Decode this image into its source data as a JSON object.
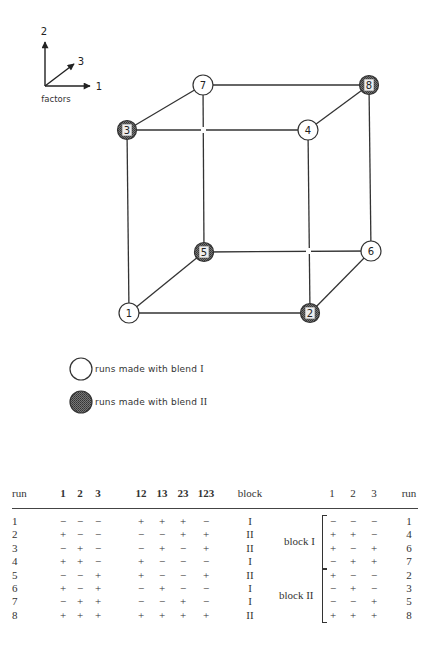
{
  "factors_key": {
    "label": "factors",
    "axis_1": "1",
    "axis_2": "2",
    "axis_3": "3"
  },
  "cube": {
    "nodes": [
      {
        "run": "1",
        "blend": "I"
      },
      {
        "run": "2",
        "blend": "II"
      },
      {
        "run": "3",
        "blend": "II"
      },
      {
        "run": "4",
        "blend": "I"
      },
      {
        "run": "5",
        "blend": "II"
      },
      {
        "run": "6",
        "blend": "I"
      },
      {
        "run": "7",
        "blend": "I"
      },
      {
        "run": "8",
        "blend": "II"
      }
    ],
    "colors": {
      "line": "#333333",
      "blend_I_fill": "#ffffff",
      "blend_II_fill": "#5a5a5a"
    }
  },
  "legend": {
    "blend_I_text": "runs made with blend",
    "blend_I_roman": "I",
    "blend_II_text": "runs made with blend",
    "blend_II_roman": "II"
  },
  "table": {
    "headers": {
      "run": "run",
      "c1": "1",
      "c2": "2",
      "c3": "3",
      "c12": "12",
      "c13": "13",
      "c23": "23",
      "c123": "123",
      "block": "block",
      "r1": "1",
      "r2": "2",
      "r3": "3",
      "rrun": "run"
    },
    "rows": [
      {
        "run": "1",
        "f1": "−",
        "f2": "−",
        "f3": "−",
        "i12": "+",
        "i13": "+",
        "i23": "+",
        "i123": "−",
        "block": "I"
      },
      {
        "run": "2",
        "f1": "+",
        "f2": "−",
        "f3": "−",
        "i12": "−",
        "i13": "−",
        "i23": "+",
        "i123": "+",
        "block": "II"
      },
      {
        "run": "3",
        "f1": "−",
        "f2": "+",
        "f3": "−",
        "i12": "−",
        "i13": "+",
        "i23": "−",
        "i123": "+",
        "block": "II"
      },
      {
        "run": "4",
        "f1": "+",
        "f2": "+",
        "f3": "−",
        "i12": "+",
        "i13": "−",
        "i23": "−",
        "i123": "−",
        "block": "I"
      },
      {
        "run": "5",
        "f1": "−",
        "f2": "−",
        "f3": "+",
        "i12": "+",
        "i13": "−",
        "i23": "−",
        "i123": "+",
        "block": "II"
      },
      {
        "run": "6",
        "f1": "+",
        "f2": "−",
        "f3": "+",
        "i12": "−",
        "i13": "+",
        "i23": "−",
        "i123": "−",
        "block": "I"
      },
      {
        "run": "7",
        "f1": "−",
        "f2": "+",
        "f3": "+",
        "i12": "−",
        "i13": "−",
        "i23": "+",
        "i123": "−",
        "block": "I"
      },
      {
        "run": "8",
        "f1": "+",
        "f2": "+",
        "f3": "+",
        "i12": "+",
        "i13": "+",
        "i23": "+",
        "i123": "+",
        "block": "II"
      }
    ],
    "blocks": [
      {
        "label": "block I",
        "rows": [
          {
            "f1": "−",
            "f2": "−",
            "f3": "−",
            "run": "1"
          },
          {
            "f1": "+",
            "f2": "+",
            "f3": "−",
            "run": "4"
          },
          {
            "f1": "+",
            "f2": "−",
            "f3": "+",
            "run": "6"
          },
          {
            "f1": "−",
            "f2": "+",
            "f3": "+",
            "run": "7"
          }
        ]
      },
      {
        "label": "block II",
        "rows": [
          {
            "f1": "+",
            "f2": "−",
            "f3": "−",
            "run": "2"
          },
          {
            "f1": "−",
            "f2": "+",
            "f3": "−",
            "run": "3"
          },
          {
            "f1": "−",
            "f2": "−",
            "f3": "+",
            "run": "5"
          },
          {
            "f1": "+",
            "f2": "+",
            "f3": "+",
            "run": "8"
          }
        ]
      }
    ]
  }
}
